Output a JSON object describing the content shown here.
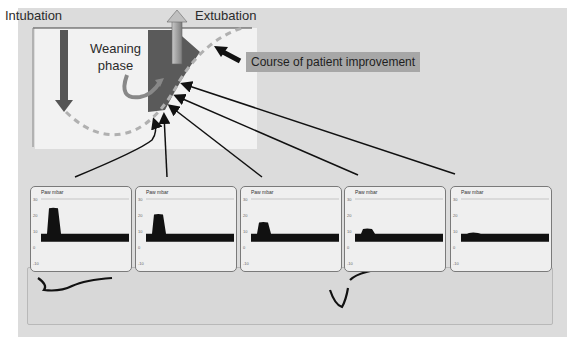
{
  "labels": {
    "intubation": "Intubation",
    "extubation": "Extubation",
    "weaning_line1": "Weaning",
    "weaning_line2": "phase",
    "course": "Course of patient improvement"
  },
  "colors": {
    "weaning_band": "#5a5a5a",
    "arrow_dark": "#3a3a3a",
    "dashed_curve": "#b0b0b0",
    "course_box": "#a7a7a7"
  },
  "monitors": [
    {
      "title": "Paw mbar",
      "y_ticks": [
        "30",
        "20",
        "10",
        "0",
        "-10"
      ],
      "peak": 23,
      "baseline": 5,
      "peep_top": 7
    },
    {
      "title": "Paw mbar",
      "y_ticks": [
        "30",
        "20",
        "10",
        "0",
        "-10"
      ],
      "peak": 19,
      "baseline": 5,
      "peep_top": 7
    },
    {
      "title": "Paw mbar",
      "y_ticks": [
        "30",
        "20",
        "10",
        "0",
        "-10"
      ],
      "peak": 14,
      "baseline": 5,
      "peep_top": 7
    },
    {
      "title": "Paw mbar",
      "y_ticks": [
        "30",
        "20",
        "10",
        "0",
        "-10"
      ],
      "peak": 10,
      "baseline": 5,
      "peep_top": 7
    },
    {
      "title": "Paw mbar",
      "y_ticks": [
        "30",
        "20",
        "10",
        "0",
        "-10"
      ],
      "peak": 7.5,
      "baseline": 5,
      "peep_top": 7
    }
  ]
}
